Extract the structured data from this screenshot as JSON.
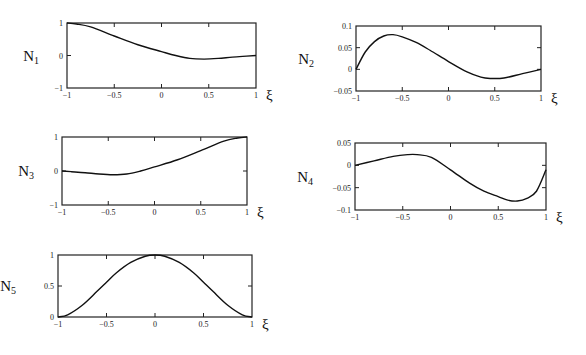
{
  "chart_data": [
    {
      "type": "line",
      "name": "N1",
      "ylabel_main": "N",
      "ylabel_sub": "1",
      "xlabel": "ξ",
      "xlim": [
        -1,
        1
      ],
      "ylim": [
        -1,
        1
      ],
      "xticks": [
        "-1",
        "-0.5",
        "0",
        "0.5",
        "1"
      ],
      "yticks": [
        "-1",
        "0",
        "1"
      ],
      "frame": {
        "x0": 67,
        "y0": 23,
        "x1": 256,
        "y1": 88
      },
      "x": [
        -1,
        -0.9,
        -0.75,
        -0.5,
        -0.25,
        0,
        0.15,
        0.3,
        0.45,
        0.6,
        0.75,
        0.9,
        1
      ],
      "values": [
        1,
        0.97,
        0.88,
        0.6,
        0.33,
        0.12,
        0.0,
        -0.09,
        -0.11,
        -0.09,
        -0.05,
        -0.02,
        0
      ]
    },
    {
      "type": "line",
      "name": "N2",
      "ylabel_main": "N",
      "ylabel_sub": "2",
      "xlabel": "ξ",
      "xlim": [
        -1,
        1
      ],
      "ylim": [
        -0.05,
        0.1
      ],
      "xticks": [
        "-1",
        "-0.5",
        "0",
        "0.5",
        "1"
      ],
      "yticks": [
        "-0.05",
        "0",
        "0.05",
        "0.1"
      ],
      "frame": {
        "x0": 356,
        "y0": 26,
        "x1": 541,
        "y1": 91
      },
      "x": [
        -1,
        -0.9,
        -0.8,
        -0.7,
        -0.6,
        -0.5,
        -0.35,
        -0.2,
        0,
        0.2,
        0.35,
        0.45,
        0.6,
        0.8,
        1
      ],
      "values": [
        0,
        0.04,
        0.064,
        0.077,
        0.08,
        0.075,
        0.062,
        0.044,
        0.018,
        -0.006,
        -0.018,
        -0.021,
        -0.02,
        -0.01,
        0
      ]
    },
    {
      "type": "line",
      "name": "N3",
      "ylabel_main": "N",
      "ylabel_sub": "3",
      "xlabel": "ξ",
      "xlim": [
        -1,
        1
      ],
      "ylim": [
        -1,
        1
      ],
      "xticks": [
        "-1",
        "-0.5",
        "0",
        "0.5",
        "1"
      ],
      "yticks": [
        "-1",
        "0",
        "1"
      ],
      "frame": {
        "x0": 62,
        "y0": 137,
        "x1": 247,
        "y1": 205
      },
      "x": [
        -1,
        -0.9,
        -0.75,
        -0.6,
        -0.45,
        -0.3,
        -0.15,
        0,
        0.25,
        0.5,
        0.75,
        0.9,
        1
      ],
      "values": [
        0,
        -0.02,
        -0.05,
        -0.09,
        -0.11,
        -0.09,
        0.0,
        0.12,
        0.33,
        0.6,
        0.88,
        0.97,
        1
      ]
    },
    {
      "type": "line",
      "name": "N4",
      "ylabel_main": "N",
      "ylabel_sub": "4",
      "xlabel": "ξ",
      "xlim": [
        -1,
        1
      ],
      "ylim": [
        -0.1,
        0.05
      ],
      "xticks": [
        "-1",
        "-0.5",
        "0",
        "0.5",
        "1"
      ],
      "yticks": [
        "-0.1",
        "-0.05",
        "0",
        "0.05"
      ],
      "frame": {
        "x0": 355,
        "y0": 143,
        "x1": 546,
        "y1": 210
      },
      "x": [
        -1,
        -0.8,
        -0.6,
        -0.45,
        -0.35,
        -0.2,
        0,
        0.2,
        0.35,
        0.5,
        0.6,
        0.7,
        0.8,
        0.9,
        1
      ],
      "values": [
        0,
        0.01,
        0.02,
        0.024,
        0.024,
        0.018,
        -0.01,
        -0.04,
        -0.058,
        -0.07,
        -0.078,
        -0.08,
        -0.074,
        -0.058,
        -0.01
      ]
    },
    {
      "type": "line",
      "name": "N5",
      "ylabel_main": "N",
      "ylabel_sub": "5",
      "xlabel": "ξ",
      "xlim": [
        -1,
        1
      ],
      "ylim": [
        0,
        1
      ],
      "xticks": [
        "-1",
        "-0.5",
        "0",
        "0.5",
        "1"
      ],
      "yticks": [
        "0",
        "0.5",
        "1"
      ],
      "frame": {
        "x0": 58,
        "y0": 255,
        "x1": 252,
        "y1": 317
      },
      "x": [
        -1,
        -0.9,
        -0.75,
        -0.6,
        -0.5,
        -0.4,
        -0.25,
        -0.1,
        0,
        0.1,
        0.25,
        0.4,
        0.5,
        0.6,
        0.75,
        0.9,
        1
      ],
      "values": [
        0,
        0.036,
        0.19,
        0.41,
        0.56,
        0.71,
        0.88,
        0.98,
        1,
        0.98,
        0.88,
        0.71,
        0.56,
        0.41,
        0.19,
        0.036,
        0
      ]
    }
  ]
}
